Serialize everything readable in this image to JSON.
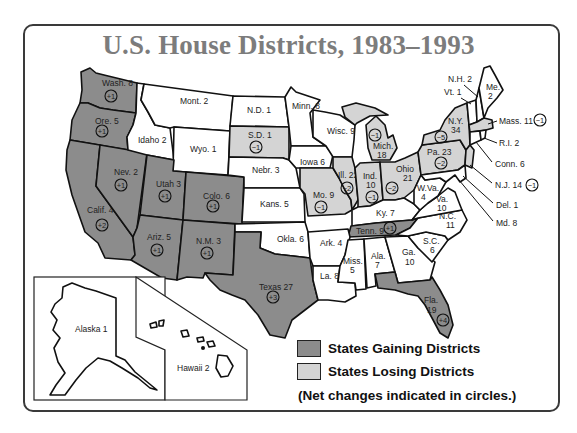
{
  "title": "U.S. House Districts, 1983–1993",
  "colors": {
    "gain": "#8c8c8c",
    "lose": "#d4d4d4",
    "neutral": "#ffffff",
    "title": "#7c7c7c",
    "border": "#111111"
  },
  "legend": {
    "gain_label": "States Gaining Districts",
    "lose_label": "States Losing Districts",
    "note": "(Net changes indicated in circles.)"
  },
  "states": {
    "wa": {
      "label": "Wash. 8",
      "change": "+1",
      "status": "gain"
    },
    "or": {
      "label": "Ore. 5",
      "change": "+1",
      "status": "gain"
    },
    "ca": {
      "label": "Calif. 45",
      "change": "+2",
      "status": "gain"
    },
    "nv": {
      "label": "Nev. 2",
      "change": "+1",
      "status": "gain"
    },
    "id": {
      "label": "Idaho 2",
      "status": "neutral"
    },
    "mt": {
      "label": "Mont. 2",
      "status": "neutral"
    },
    "wy": {
      "label": "Wyo. 1",
      "status": "neutral"
    },
    "ut": {
      "label": "Utah 3",
      "change": "+1",
      "status": "gain"
    },
    "az": {
      "label": "Ariz. 5",
      "change": "+1",
      "status": "gain"
    },
    "co": {
      "label": "Colo. 6",
      "change": "+1",
      "status": "gain"
    },
    "nm": {
      "label": "N.M. 3",
      "change": "+1",
      "status": "gain"
    },
    "nd": {
      "label": "N.D. 1",
      "status": "neutral"
    },
    "sd": {
      "label": "S.D. 1",
      "change": "−1",
      "status": "lose"
    },
    "ne": {
      "label": "Nebr. 3",
      "status": "neutral"
    },
    "ks": {
      "label": "Kans. 5",
      "status": "neutral"
    },
    "ok": {
      "label": "Okla. 6",
      "status": "neutral"
    },
    "tx": {
      "label": "Texas 27",
      "change": "+3",
      "status": "gain"
    },
    "mn": {
      "label": "Minn. 8",
      "status": "neutral"
    },
    "ia": {
      "label": "Iowa 6",
      "status": "neutral"
    },
    "mo": {
      "label": "Mo. 9",
      "change": "−1",
      "status": "lose"
    },
    "ar": {
      "label": "Ark. 4",
      "status": "neutral"
    },
    "la": {
      "label": "La. 8",
      "status": "neutral"
    },
    "wi": {
      "label": "Wisc. 9",
      "status": "neutral"
    },
    "il": {
      "label": "Ill. 22",
      "change": "−2",
      "status": "lose"
    },
    "mi": {
      "label_1": "Mich.",
      "label_2": "18",
      "change": "−1",
      "status": "lose"
    },
    "in": {
      "label_1": "Ind.",
      "label_2": "10",
      "change": "−1",
      "status": "lose"
    },
    "oh": {
      "label_1": "Ohio",
      "label_2": "21",
      "change": "−2",
      "status": "lose"
    },
    "ky": {
      "label": "Ky. 7",
      "status": "neutral"
    },
    "tn": {
      "label": "Tenn. 9",
      "change": "+1",
      "status": "gain"
    },
    "ms": {
      "label_1": "Miss.",
      "label_2": "5",
      "status": "neutral"
    },
    "al": {
      "label_1": "Ala.",
      "label_2": "7",
      "status": "neutral"
    },
    "ga": {
      "label_1": "Ga.",
      "label_2": "10",
      "status": "neutral"
    },
    "fl": {
      "label_1": "Fla.",
      "label_2": "19",
      "change": "+4",
      "status": "gain"
    },
    "sc": {
      "label_1": "S.C.",
      "label_2": "6",
      "status": "neutral"
    },
    "nc": {
      "label_1": "N.C.",
      "label_2": "11",
      "status": "neutral"
    },
    "va": {
      "label_1": "Va.",
      "label_2": "10",
      "status": "neutral"
    },
    "wv": {
      "label_1": "W.Va.",
      "label_2": "4",
      "status": "neutral"
    },
    "pa": {
      "label": "Pa. 23",
      "change": "−2",
      "status": "lose"
    },
    "ny": {
      "label_1": "N.Y.",
      "label_2": "34",
      "change": "−5",
      "status": "lose"
    },
    "me": {
      "label_1": "Me.",
      "label_2": "2",
      "status": "neutral"
    },
    "nh": {
      "label": "N.H. 2",
      "status": "neutral"
    },
    "vt": {
      "label": "Vt. 1",
      "status": "neutral"
    },
    "ma": {
      "label": "Mass. 11",
      "change": "−1",
      "status": "lose"
    },
    "ri": {
      "label": "R.I. 2",
      "status": "neutral"
    },
    "ct": {
      "label": "Conn. 6",
      "status": "neutral"
    },
    "nj": {
      "label": "N.J. 14",
      "change": "−1",
      "status": "lose"
    },
    "de": {
      "label": "Del. 1",
      "status": "neutral"
    },
    "md": {
      "label": "Md. 8",
      "status": "neutral"
    },
    "ak": {
      "label": "Alaska 1",
      "status": "neutral"
    },
    "hi": {
      "label": "Hawaii 2",
      "status": "neutral"
    }
  }
}
